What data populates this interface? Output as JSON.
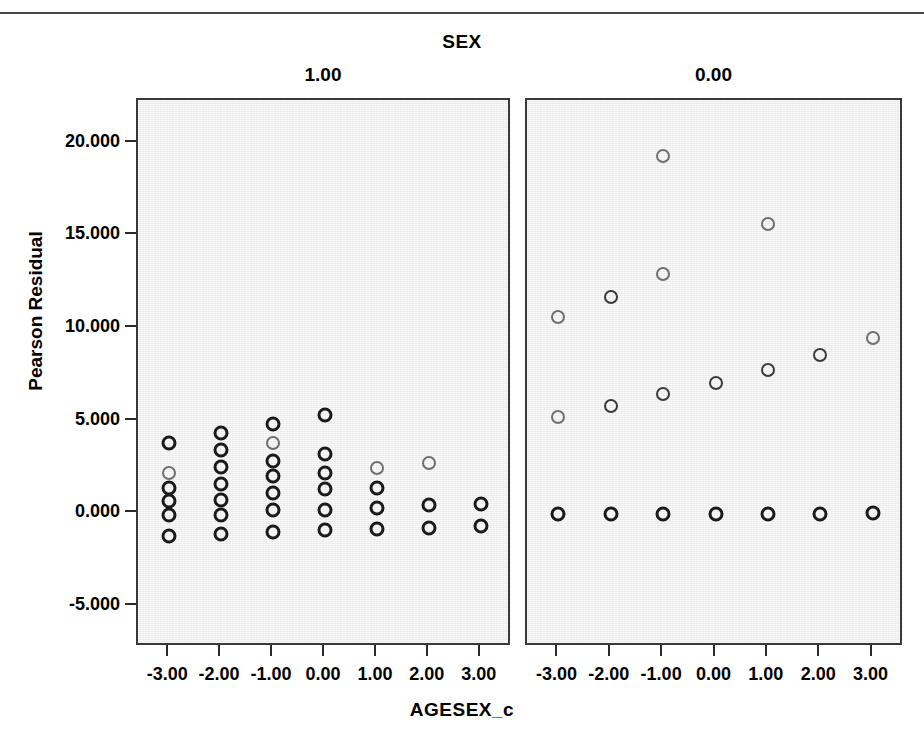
{
  "figure": {
    "title": "SEX",
    "xlabel": "AGESEX_c",
    "ylabel": "Pearson Residual",
    "panel_labels": [
      "1.00",
      "0.00"
    ]
  },
  "axes": {
    "y_ticks": [
      "20.000",
      "15.000",
      "10.000",
      "5.000",
      "0.000",
      "-5.000"
    ],
    "y_tick_values": [
      20,
      15,
      10,
      5,
      0,
      -5
    ],
    "x_ticks": [
      "-3.00",
      "-2.00",
      "-1.00",
      "0.00",
      "1.00",
      "2.00",
      "3.00"
    ],
    "x_tick_values": [
      -3,
      -2,
      -1,
      0,
      1,
      2,
      3
    ]
  },
  "colors": {
    "panel_fill": "#ebebeb",
    "frame": "#3a3a3a",
    "marker_dark": "#1a1a1a",
    "marker_light": "#6f6f6f",
    "text": "#000000"
  },
  "chart_data": {
    "type": "scatter",
    "title": "SEX",
    "xlabel": "AGESEX_c",
    "ylabel": "Pearson Residual",
    "xlim": [
      -3.6,
      3.6
    ],
    "ylim": [
      -7.2,
      22.3
    ],
    "grid": false,
    "legend": "none",
    "facet_variable": "SEX",
    "panels": [
      {
        "label": "1.00",
        "points": [
          {
            "x": -3,
            "y": 3.8,
            "shade": "dark"
          },
          {
            "x": -3,
            "y": 2.2,
            "shade": "light"
          },
          {
            "x": -3,
            "y": 1.4,
            "shade": "dark"
          },
          {
            "x": -3,
            "y": 0.7,
            "shade": "dark"
          },
          {
            "x": -3,
            "y": -0.1,
            "shade": "dark"
          },
          {
            "x": -3,
            "y": -1.2,
            "shade": "dark"
          },
          {
            "x": -2,
            "y": 4.35,
            "shade": "dark"
          },
          {
            "x": -2,
            "y": 3.4,
            "shade": "dark"
          },
          {
            "x": -2,
            "y": 2.5,
            "shade": "dark"
          },
          {
            "x": -2,
            "y": 1.6,
            "shade": "dark"
          },
          {
            "x": -2,
            "y": 0.75,
            "shade": "dark"
          },
          {
            "x": -2,
            "y": -0.1,
            "shade": "dark"
          },
          {
            "x": -2,
            "y": -1.1,
            "shade": "dark"
          },
          {
            "x": -1,
            "y": 4.8,
            "shade": "dark"
          },
          {
            "x": -1,
            "y": 3.8,
            "shade": "light"
          },
          {
            "x": -1,
            "y": 2.85,
            "shade": "dark"
          },
          {
            "x": -1,
            "y": 2.0,
            "shade": "dark"
          },
          {
            "x": -1,
            "y": 1.1,
            "shade": "dark"
          },
          {
            "x": -1,
            "y": 0.2,
            "shade": "dark"
          },
          {
            "x": -1,
            "y": -1.0,
            "shade": "dark"
          },
          {
            "x": 0,
            "y": 5.3,
            "shade": "dark"
          },
          {
            "x": 0,
            "y": 3.2,
            "shade": "dark"
          },
          {
            "x": 0,
            "y": 2.2,
            "shade": "dark"
          },
          {
            "x": 0,
            "y": 1.3,
            "shade": "dark"
          },
          {
            "x": 0,
            "y": 0.2,
            "shade": "dark"
          },
          {
            "x": 0,
            "y": -0.9,
            "shade": "dark"
          },
          {
            "x": 1,
            "y": 2.45,
            "shade": "light"
          },
          {
            "x": 1,
            "y": 1.35,
            "shade": "dark"
          },
          {
            "x": 1,
            "y": 0.3,
            "shade": "dark"
          },
          {
            "x": 1,
            "y": -0.85,
            "shade": "dark"
          },
          {
            "x": 2,
            "y": 2.7,
            "shade": "light"
          },
          {
            "x": 2,
            "y": 0.45,
            "shade": "dark"
          },
          {
            "x": 2,
            "y": -0.8,
            "shade": "dark"
          },
          {
            "x": 3,
            "y": 0.5,
            "shade": "dark"
          },
          {
            "x": 3,
            "y": -0.7,
            "shade": "dark"
          }
        ]
      },
      {
        "label": "0.00",
        "points": [
          {
            "x": -3,
            "y": 10.6,
            "shade": "light"
          },
          {
            "x": -3,
            "y": 5.2,
            "shade": "light"
          },
          {
            "x": -3,
            "y": -0.05,
            "shade": "dark"
          },
          {
            "x": -2,
            "y": 11.65,
            "shade": "mid"
          },
          {
            "x": -2,
            "y": 5.8,
            "shade": "mid"
          },
          {
            "x": -2,
            "y": -0.05,
            "shade": "dark"
          },
          {
            "x": -1,
            "y": 19.3,
            "shade": "light"
          },
          {
            "x": -1,
            "y": 12.9,
            "shade": "light"
          },
          {
            "x": -1,
            "y": 6.45,
            "shade": "mid"
          },
          {
            "x": -1,
            "y": -0.05,
            "shade": "dark"
          },
          {
            "x": 0,
            "y": 7.05,
            "shade": "mid"
          },
          {
            "x": 0,
            "y": -0.05,
            "shade": "dark"
          },
          {
            "x": 1,
            "y": 15.6,
            "shade": "light"
          },
          {
            "x": 1,
            "y": 7.75,
            "shade": "mid"
          },
          {
            "x": 1,
            "y": -0.05,
            "shade": "dark"
          },
          {
            "x": 2,
            "y": 8.55,
            "shade": "mid"
          },
          {
            "x": 2,
            "y": -0.05,
            "shade": "dark"
          },
          {
            "x": 3,
            "y": 9.45,
            "shade": "light"
          },
          {
            "x": 3,
            "y": 0.05,
            "shade": "dark"
          }
        ]
      }
    ]
  }
}
